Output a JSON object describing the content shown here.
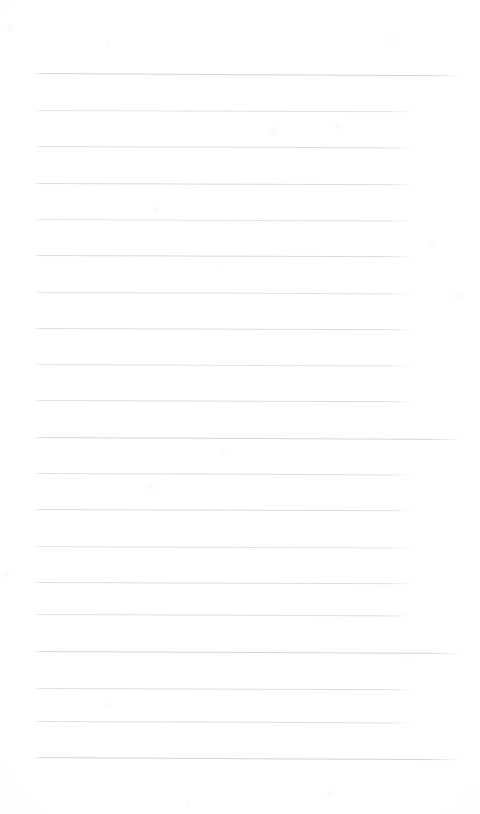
{
  "page": {
    "kind": "scanned-blank-ruled-notebook-page",
    "width": 480,
    "height": 814,
    "background_color": "#ffffff",
    "paper_tint_color": "#fcfcfd",
    "has_text_content": false,
    "has_handwriting": false,
    "has_margin_rule": false,
    "has_holes": false,
    "orientation": "portrait",
    "visible_text": ""
  },
  "rules": {
    "count": 20,
    "ink_color": "#d9d9dd",
    "ink_color_faint": "#e6e6ea",
    "thickness_px": 1,
    "left_x": 33,
    "short_right_x": 413,
    "long_right_x": 461,
    "first_y": 73,
    "spacing_px": 36,
    "tilt_deg": 0.22,
    "items": [
      {
        "index": 1,
        "y": 73,
        "x1": 33,
        "x2": 461,
        "tilt": 0.3,
        "opacity": 0.95,
        "tone": "#d4d4d9"
      },
      {
        "index": 2,
        "y": 110,
        "x1": 33,
        "x2": 413,
        "tilt": 0.2,
        "opacity": 0.8,
        "tone": "#dcdce0"
      },
      {
        "index": 3,
        "y": 146,
        "x1": 33,
        "x2": 412,
        "tilt": 0.22,
        "opacity": 0.85,
        "tone": "#d8d8dd"
      },
      {
        "index": 4,
        "y": 183,
        "x1": 33,
        "x2": 413,
        "tilt": 0.18,
        "opacity": 0.88,
        "tone": "#d6d6db"
      },
      {
        "index": 5,
        "y": 219,
        "x1": 33,
        "x2": 412,
        "tilt": 0.24,
        "opacity": 0.82,
        "tone": "#dadade"
      },
      {
        "index": 6,
        "y": 255,
        "x1": 33,
        "x2": 413,
        "tilt": 0.2,
        "opacity": 0.9,
        "tone": "#d5d5da"
      },
      {
        "index": 7,
        "y": 292,
        "x1": 33,
        "x2": 412,
        "tilt": 0.22,
        "opacity": 0.84,
        "tone": "#d9d9de"
      },
      {
        "index": 8,
        "y": 328,
        "x1": 33,
        "x2": 413,
        "tilt": 0.19,
        "opacity": 0.87,
        "tone": "#d7d7dc"
      },
      {
        "index": 9,
        "y": 364,
        "x1": 33,
        "x2": 412,
        "tilt": 0.23,
        "opacity": 0.83,
        "tone": "#dbdbdf"
      },
      {
        "index": 10,
        "y": 400,
        "x1": 33,
        "x2": 413,
        "tilt": 0.2,
        "opacity": 0.86,
        "tone": "#d7d7dc"
      },
      {
        "index": 11,
        "y": 437,
        "x1": 33,
        "x2": 461,
        "tilt": 0.28,
        "opacity": 0.92,
        "tone": "#d3d3d8"
      },
      {
        "index": 12,
        "y": 473,
        "x1": 33,
        "x2": 412,
        "tilt": 0.21,
        "opacity": 0.85,
        "tone": "#d8d8dd"
      },
      {
        "index": 13,
        "y": 509,
        "x1": 33,
        "x2": 413,
        "tilt": 0.19,
        "opacity": 0.88,
        "tone": "#d6d6db"
      },
      {
        "index": 14,
        "y": 546,
        "x1": 33,
        "x2": 412,
        "tilt": 0.24,
        "opacity": 0.82,
        "tone": "#dadadf"
      },
      {
        "index": 15,
        "y": 582,
        "x1": 33,
        "x2": 413,
        "tilt": 0.2,
        "opacity": 0.87,
        "tone": "#d7d7dc"
      },
      {
        "index": 16,
        "y": 614,
        "x1": 33,
        "x2": 412,
        "tilt": 0.22,
        "opacity": 0.84,
        "tone": "#d9d9de"
      },
      {
        "index": 17,
        "y": 651,
        "x1": 33,
        "x2": 461,
        "tilt": 0.27,
        "opacity": 0.93,
        "tone": "#d3d3d8"
      },
      {
        "index": 18,
        "y": 688,
        "x1": 33,
        "x2": 413,
        "tilt": 0.2,
        "opacity": 0.86,
        "tone": "#d7d7dc"
      },
      {
        "index": 19,
        "y": 721,
        "x1": 33,
        "x2": 412,
        "tilt": 0.22,
        "opacity": 0.85,
        "tone": "#d8d8dd"
      },
      {
        "index": 20,
        "y": 757,
        "x1": 33,
        "x2": 461,
        "tilt": 0.3,
        "opacity": 0.94,
        "tone": "#d2d2d8"
      }
    ]
  },
  "speckles": [
    {
      "x": 10,
      "y": 28,
      "r": 5,
      "opacity": 0.2
    },
    {
      "x": 392,
      "y": 40,
      "r": 4,
      "opacity": 0.16
    },
    {
      "x": 108,
      "y": 43,
      "r": 3,
      "opacity": 0.14
    },
    {
      "x": 274,
      "y": 131,
      "r": 6,
      "opacity": 0.18
    },
    {
      "x": 338,
      "y": 126,
      "r": 4,
      "opacity": 0.15
    },
    {
      "x": 156,
      "y": 211,
      "r": 5,
      "opacity": 0.17
    },
    {
      "x": 432,
      "y": 245,
      "r": 4,
      "opacity": 0.13
    },
    {
      "x": 458,
      "y": 296,
      "r": 5,
      "opacity": 0.15
    },
    {
      "x": 220,
      "y": 263,
      "r": 4,
      "opacity": 0.14
    },
    {
      "x": 150,
      "y": 487,
      "r": 5,
      "opacity": 0.16
    },
    {
      "x": 222,
      "y": 452,
      "r": 4,
      "opacity": 0.13
    },
    {
      "x": 6,
      "y": 574,
      "r": 5,
      "opacity": 0.17
    },
    {
      "x": 408,
      "y": 662,
      "r": 4,
      "opacity": 0.14
    },
    {
      "x": 110,
      "y": 705,
      "r": 4,
      "opacity": 0.15
    },
    {
      "x": 330,
      "y": 794,
      "r": 5,
      "opacity": 0.14
    },
    {
      "x": 188,
      "y": 806,
      "r": 4,
      "opacity": 0.12
    }
  ]
}
